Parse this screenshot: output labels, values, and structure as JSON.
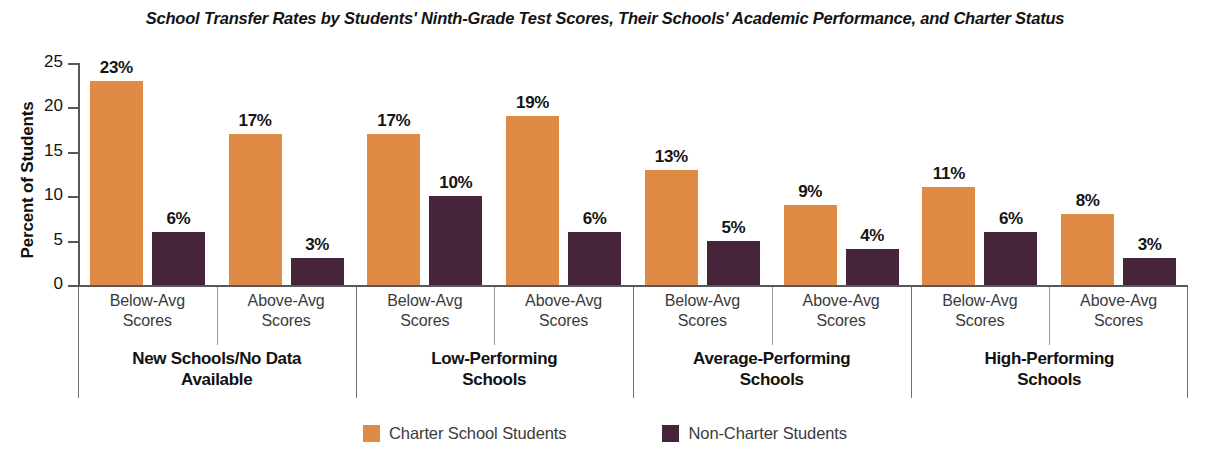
{
  "chart_data": {
    "type": "bar",
    "title": "School Transfer Rates by Students' Ninth-Grade Test Scores, Their Schools' Academic Performance, and Charter Status",
    "xlabel": "",
    "ylabel": "Percent of Students",
    "ylim": [
      0,
      25
    ],
    "yticks": [
      0,
      5,
      10,
      15,
      20,
      25
    ],
    "ytick_labels": [
      "0",
      "5",
      "10",
      "15",
      "20",
      "25"
    ],
    "grid": false,
    "legend_position": "bottom",
    "value_suffix": "%",
    "categories": [
      "New Schools/No Data Available — Below-Avg Scores",
      "New Schools/No Data Available — Above-Avg Scores",
      "Low-Performing Schools — Below-Avg Scores",
      "Low-Performing Schools — Above-Avg Scores",
      "Average-Performing Schools — Below-Avg Scores",
      "Average-Performing Schools — Above-Avg Scores",
      "High-Performing Schools — Below-Avg Scores",
      "High-Performing Schools — Above-Avg Scores"
    ],
    "series": [
      {
        "name": "Charter School Students",
        "color": "#e08b43",
        "values": [
          23,
          17,
          17,
          19,
          13,
          9,
          11,
          8
        ],
        "labels": [
          "23%",
          "17%",
          "17%",
          "19%",
          "13%",
          "9%",
          "11%",
          "8%"
        ]
      },
      {
        "name": "Non-Charter Students",
        "color": "#46253a",
        "values": [
          6,
          3,
          10,
          6,
          5,
          4,
          6,
          3
        ],
        "labels": [
          "6%",
          "3%",
          "10%",
          "6%",
          "5%",
          "4%",
          "6%",
          "3%"
        ]
      }
    ],
    "groups": [
      {
        "label_line1": "New Schools/No Data",
        "label_line2": "Available",
        "subcategories": [
          {
            "line1": "Below-Avg",
            "line2": "Scores",
            "charter": 23,
            "charter_label": "23%",
            "noncharter": 6,
            "noncharter_label": "6%"
          },
          {
            "line1": "Above-Avg",
            "line2": "Scores",
            "charter": 17,
            "charter_label": "17%",
            "noncharter": 3,
            "noncharter_label": "3%"
          }
        ]
      },
      {
        "label_line1": "Low-Performing",
        "label_line2": "Schools",
        "subcategories": [
          {
            "line1": "Below-Avg",
            "line2": "Scores",
            "charter": 17,
            "charter_label": "17%",
            "noncharter": 10,
            "noncharter_label": "10%"
          },
          {
            "line1": "Above-Avg",
            "line2": "Scores",
            "charter": 19,
            "charter_label": "19%",
            "noncharter": 6,
            "noncharter_label": "6%"
          }
        ]
      },
      {
        "label_line1": "Average-Performing",
        "label_line2": "Schools",
        "subcategories": [
          {
            "line1": "Below-Avg",
            "line2": "Scores",
            "charter": 13,
            "charter_label": "13%",
            "noncharter": 5,
            "noncharter_label": "5%"
          },
          {
            "line1": "Above-Avg",
            "line2": "Scores",
            "charter": 9,
            "charter_label": "9%",
            "noncharter": 4,
            "noncharter_label": "4%"
          }
        ]
      },
      {
        "label_line1": "High-Performing",
        "label_line2": "Schools",
        "subcategories": [
          {
            "line1": "Below-Avg",
            "line2": "Scores",
            "charter": 11,
            "charter_label": "11%",
            "noncharter": 6,
            "noncharter_label": "6%"
          },
          {
            "line1": "Above-Avg",
            "line2": "Scores",
            "charter": 8,
            "charter_label": "8%",
            "noncharter": 3,
            "noncharter_label": "3%"
          }
        ]
      }
    ],
    "legend": [
      {
        "label": "Charter School Students",
        "color": "#e08b43"
      },
      {
        "label": "Non-Charter Students",
        "color": "#46253a"
      }
    ]
  }
}
